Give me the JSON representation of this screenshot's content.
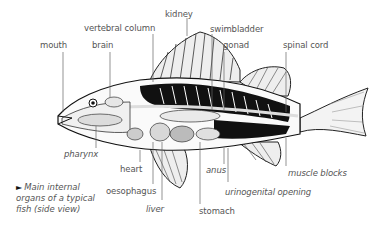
{
  "diagram": {
    "title": "Main internal organs of a typical fish (side view)",
    "caption_marker": "►",
    "caption_lines": [
      "Main internal",
      "organs of a typical",
      "fish (side view)"
    ],
    "labels": {
      "mouth": "mouth",
      "brain": "brain",
      "vertebral_column": "vertebral column",
      "kidney": "kidney",
      "swimbladder": "swimbladder",
      "gonad": "gonad",
      "spinal_cord": "spinal cord",
      "pharynx": "pharynx",
      "heart": "heart",
      "oesophagus": "oesophagus",
      "liver": "liver",
      "stomach": "stomach",
      "anus": "anus",
      "urinogenital_opening": "urinogenital opening",
      "muscle_blocks": "muscle blocks"
    },
    "colors": {
      "label_text": "#555555",
      "leader_line": "#555555",
      "ink": "#111111",
      "background": "#ffffff"
    }
  }
}
